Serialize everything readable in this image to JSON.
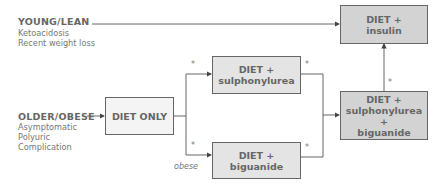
{
  "groups": {
    "young": {
      "title": "YOUNG/LEAN",
      "lines": [
        "Ketoacidosis",
        "Recent weight loss"
      ]
    },
    "older": {
      "title": "OLDER/OBESE",
      "lines": [
        "Asymptomatic",
        "Polyuric",
        "Complication"
      ]
    }
  },
  "boxes": {
    "diet_only": {
      "lines": [
        "DIET ONLY"
      ]
    },
    "diet_sulph": {
      "lines": [
        "DIET +",
        "sulphonylurea"
      ]
    },
    "diet_biguanide": {
      "lines": [
        "DIET +",
        "biguanide"
      ]
    },
    "diet_insulin": {
      "lines": [
        "DIET +",
        "insulin"
      ]
    },
    "diet_sulph_biguanide": {
      "lines": [
        "DIET +",
        "sulphonylurea +",
        "biguanide"
      ]
    }
  },
  "annotations": {
    "star": "*",
    "obese": "obese"
  },
  "colors": {
    "line": "#555555",
    "text": "#666666",
    "box_light": "#f4f4f4",
    "box_mid": "#e4e4e4",
    "box_dark": "#d3d3d3"
  }
}
